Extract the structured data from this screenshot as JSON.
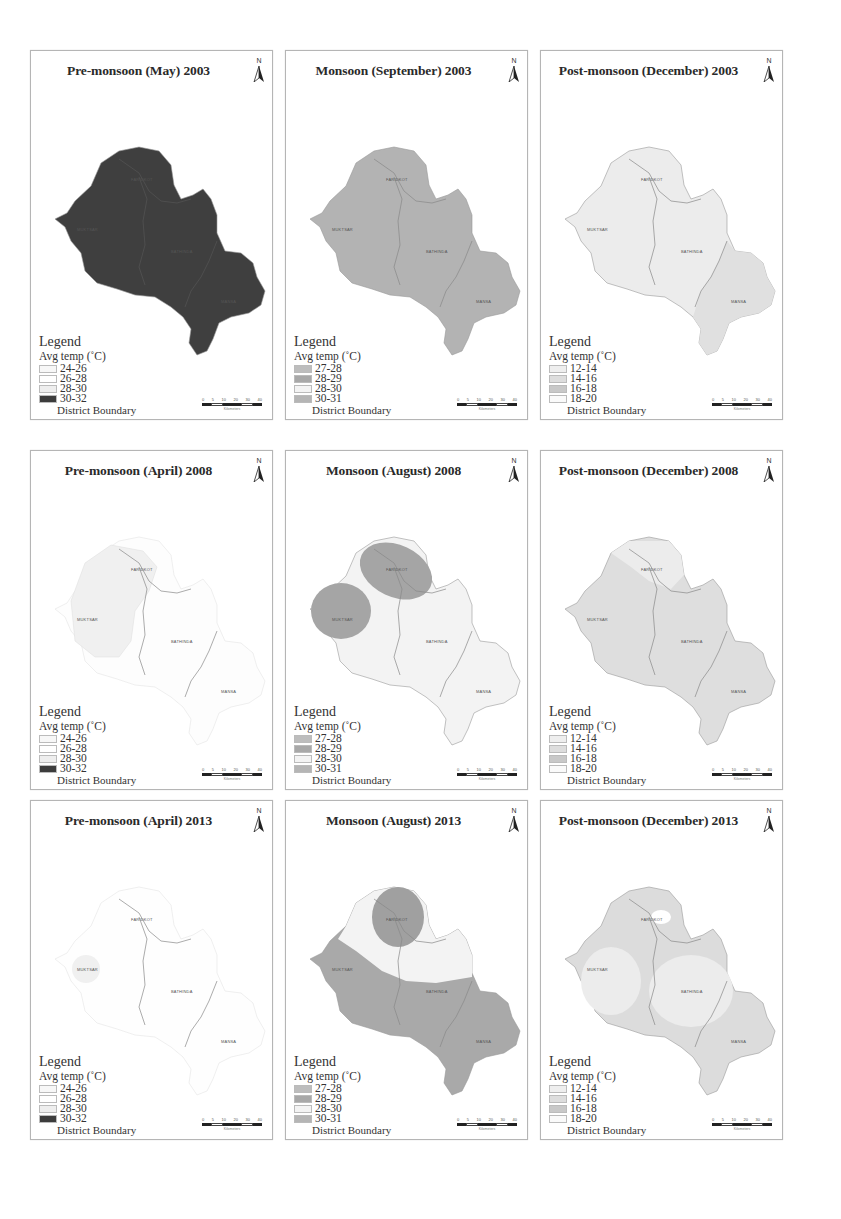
{
  "figure": {
    "rows": 3,
    "cols": 3,
    "panels": [
      {
        "title": "Pre-monsoon (May) 2003",
        "legend_title": "Legend",
        "legend_sub": "Avg temp (˚C)",
        "classes": [
          {
            "label": "24-26",
            "color": "#f7f7f7"
          },
          {
            "label": "26-28",
            "color": "#ffffff"
          },
          {
            "label": "28-30",
            "color": "#eeeeee"
          },
          {
            "label": "30-32",
            "color": "#3c3c3c"
          }
        ],
        "boundary_label": "District Boundary",
        "districts": {
          "faridkot": "FARIDKOT",
          "muktsar": "MUKTSAR",
          "bathinda": "BATHINDA",
          "mansa": "MANSA"
        },
        "fill": {
          "main": "#3f3f3f"
        }
      },
      {
        "title": "Monsoon (September) 2003",
        "legend_title": "Legend",
        "legend_sub": "Avg temp (˚C)",
        "classes": [
          {
            "label": "27-28",
            "color": "#bdbdbd"
          },
          {
            "label": "28-29",
            "color": "#a8a8a8"
          },
          {
            "label": "28-30",
            "color": "#f3f3f3"
          },
          {
            "label": "30-31",
            "color": "#b5b5b5"
          }
        ],
        "boundary_label": "District Boundary",
        "districts": {
          "faridkot": "FARIDKOT",
          "muktsar": "MUKTSAR",
          "bathinda": "BATHINDA",
          "mansa": "MANSA"
        },
        "fill": {
          "main": "#b3b3b3"
        }
      },
      {
        "title": "Post-monsoon (December) 2003",
        "legend_title": "Legend",
        "legend_sub": "Avg temp (˚C)",
        "classes": [
          {
            "label": "12-14",
            "color": "#eeeeee"
          },
          {
            "label": "14-16",
            "color": "#dddddd"
          },
          {
            "label": "16-18",
            "color": "#c8c8c8"
          },
          {
            "label": "18-20",
            "color": "#fafafa"
          }
        ],
        "boundary_label": "District Boundary",
        "districts": {
          "faridkot": "FARIDKOT",
          "muktsar": "MUKTSAR",
          "bathinda": "BATHINDA",
          "mansa": "MANSA"
        },
        "fill": {
          "main": "#ececec",
          "mansa": "#e0e0e0"
        }
      },
      {
        "title": "Pre-monsoon (April) 2008",
        "legend_title": "Legend",
        "legend_sub": "Avg temp (˚C)",
        "classes": [
          {
            "label": "24-26",
            "color": "#f7f7f7"
          },
          {
            "label": "26-28",
            "color": "#ffffff"
          },
          {
            "label": "28-30",
            "color": "#eeeeee"
          },
          {
            "label": "30-32",
            "color": "#3c3c3c"
          }
        ],
        "boundary_label": "District Boundary",
        "districts": {
          "faridkot": "FARIDKOT",
          "muktsar": "MUKTSAR",
          "bathinda": "BATHINDA",
          "mansa": "MANSA"
        },
        "fill": {
          "main": "#fdfdfd",
          "west": "#f0f0f0"
        }
      },
      {
        "title": "Monsoon (August) 2008",
        "legend_title": "Legend",
        "legend_sub": "Avg temp (˚C)",
        "classes": [
          {
            "label": "27-28",
            "color": "#bdbdbd"
          },
          {
            "label": "28-29",
            "color": "#a8a8a8"
          },
          {
            "label": "28-30",
            "color": "#f3f3f3"
          },
          {
            "label": "30-31",
            "color": "#b5b5b5"
          }
        ],
        "boundary_label": "District Boundary",
        "districts": {
          "faridkot": "FARIDKOT",
          "muktsar": "MUKTSAR",
          "bathinda": "BATHINDA",
          "mansa": "MANSA"
        },
        "fill": {
          "main": "#f3f3f3",
          "blob": "#a5a5a5"
        }
      },
      {
        "title": "Post-monsoon (December) 2008",
        "legend_title": "Legend",
        "legend_sub": "Avg temp (˚C)",
        "classes": [
          {
            "label": "12-14",
            "color": "#eeeeee"
          },
          {
            "label": "14-16",
            "color": "#dddddd"
          },
          {
            "label": "16-18",
            "color": "#c8c8c8"
          },
          {
            "label": "18-20",
            "color": "#fafafa"
          }
        ],
        "boundary_label": "District Boundary",
        "districts": {
          "faridkot": "FARIDKOT",
          "muktsar": "MUKTSAR",
          "bathinda": "BATHINDA",
          "mansa": "MANSA"
        },
        "fill": {
          "main": "#dedede",
          "north": "#ececec"
        }
      },
      {
        "title": "Pre-monsoon (April) 2013",
        "legend_title": "Legend",
        "legend_sub": "Avg temp (˚C)",
        "classes": [
          {
            "label": "24-26",
            "color": "#f7f7f7"
          },
          {
            "label": "26-28",
            "color": "#ffffff"
          },
          {
            "label": "28-30",
            "color": "#eeeeee"
          },
          {
            "label": "30-32",
            "color": "#3c3c3c"
          }
        ],
        "boundary_label": "District Boundary",
        "districts": {
          "faridkot": "FARIDKOT",
          "muktsar": "MUKTSAR",
          "bathinda": "BATHINDA",
          "mansa": "MANSA"
        },
        "fill": {
          "main": "#fefefe",
          "blob": "#f0f0f0"
        }
      },
      {
        "title": "Monsoon (August) 2013",
        "legend_title": "Legend",
        "legend_sub": "Avg temp (˚C)",
        "classes": [
          {
            "label": "27-28",
            "color": "#bdbdbd"
          },
          {
            "label": "28-29",
            "color": "#a8a8a8"
          },
          {
            "label": "28-30",
            "color": "#f3f3f3"
          },
          {
            "label": "30-31",
            "color": "#b5b5b5"
          }
        ],
        "boundary_label": "District Boundary",
        "districts": {
          "faridkot": "FARIDKOT",
          "muktsar": "MUKTSAR",
          "bathinda": "BATHINDA",
          "mansa": "MANSA"
        },
        "fill": {
          "main": "#a9a9a9",
          "north": "#f3f3f3",
          "blob": "#a0a0a0"
        }
      },
      {
        "title": "Post-monsoon (December) 2013",
        "legend_title": "Legend",
        "legend_sub": "Avg temp (˚C)",
        "classes": [
          {
            "label": "12-14",
            "color": "#eeeeee"
          },
          {
            "label": "14-16",
            "color": "#dddddd"
          },
          {
            "label": "16-18",
            "color": "#c8c8c8"
          },
          {
            "label": "18-20",
            "color": "#fafafa"
          }
        ],
        "boundary_label": "District Boundary",
        "districts": {
          "faridkot": "FARIDKOT",
          "muktsar": "MUKTSAR",
          "bathinda": "BATHINDA",
          "mansa": "MANSA"
        },
        "fill": {
          "main": "#dcdcdc",
          "center": "#ececec",
          "blob": "#ffffff"
        }
      }
    ],
    "north_label": "N",
    "scale": {
      "ticks": [
        "0",
        "5",
        "10",
        "20",
        "30",
        "40"
      ],
      "unit": "Kilometers"
    }
  }
}
